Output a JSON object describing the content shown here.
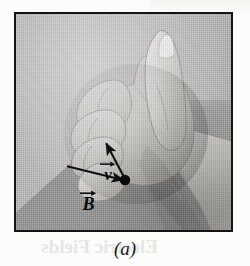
{
  "figure": {
    "caption": "(a)",
    "type": "photograph-with-vector-overlay",
    "frame": {
      "border_color": "#141414",
      "background_color": "#b8b8b8"
    }
  },
  "vectors": [
    {
      "name": "velocity",
      "symbol": "v",
      "label": "v",
      "accent": "arrow-over",
      "color": "#111111",
      "origin_point": "charge-dot",
      "direction": "up-left"
    },
    {
      "name": "magnetic-field",
      "symbol": "B",
      "label": "B",
      "accent": "arrow-over",
      "color": "#111111",
      "origin_point": "left-tail",
      "direction": "right-down-toward-charge"
    }
  ],
  "markers": {
    "charge_dot": {
      "name": "charge-dot",
      "color": "#0a0a0a"
    }
  },
  "page": {
    "show_through_text": "Electric Fields",
    "background_color": "#fcfcfb"
  }
}
